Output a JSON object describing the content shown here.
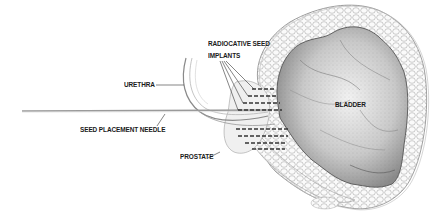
{
  "diagram": {
    "labels": {
      "radioactive_seed_line1": "RADIOCATIVE SEED",
      "radioactive_seed_line2": "IMPLANTS",
      "urethra": "URETHRA",
      "seed_placement_needle": "SEED PLACEMENT NEEDLE",
      "prostate": "PROSTATE",
      "bladder": "BLADDER"
    },
    "colors": {
      "ink": "#1a1a1a",
      "line": "#555555",
      "shade_dark": "#6e6e6e",
      "shade_mid": "#a8a8a8",
      "shade_light": "#d9d9d9",
      "background": "#ffffff"
    }
  }
}
